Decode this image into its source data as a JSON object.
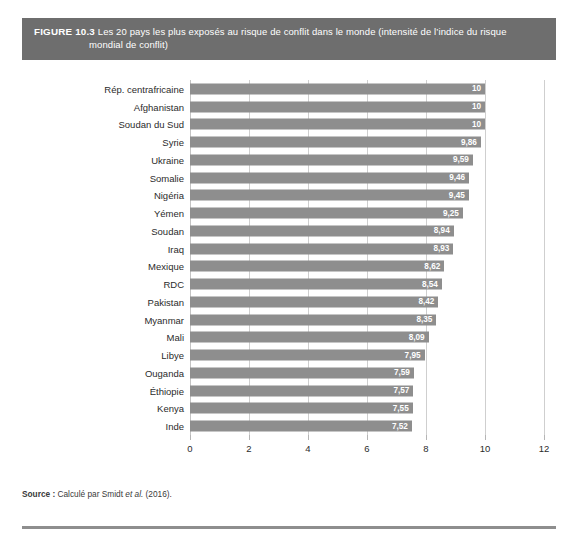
{
  "figure": {
    "number": "FIGURE 10.3",
    "caption_line1": "Les 20 pays les plus exposés au risque de conflit dans le monde (intensité de l’indice du risque",
    "caption_line2": "mondial de conflit)"
  },
  "source": {
    "label": "Source :",
    "text_before_italic": " Calculé par Smidt ",
    "italic": "et al.",
    "text_after_italic": " (2016)."
  },
  "colors": {
    "header_band": "#6e6e6e",
    "bar_fill": "#8e8e8e",
    "gridline": "#cfcfcf",
    "value_label": "#ffffff",
    "bottom_rule": "#8e8e8e"
  },
  "chart_data": {
    "type": "bar",
    "orientation": "horizontal",
    "title": "Les 20 pays les plus exposés au risque de conflit dans le monde (intensité de l’indice du risque mondial de conflit)",
    "xlabel": "",
    "ylabel": "",
    "xlim": [
      0,
      12
    ],
    "xticks": [
      "0",
      "2",
      "4",
      "6",
      "8",
      "10",
      "12"
    ],
    "xtick_values": [
      0,
      2,
      4,
      6,
      8,
      10,
      12
    ],
    "grid": "vertical",
    "legend": "none",
    "decimal_separator": ",",
    "categories": [
      "Rép. centrafricaine",
      "Afghanistan",
      "Soudan du Sud",
      "Syrie",
      "Ukraine",
      "Somalie",
      "Nigéria",
      "Yémen",
      "Soudan",
      "Iraq",
      "Mexique",
      "RDC",
      "Pakistan",
      "Myanmar",
      "Mali",
      "Libye",
      "Ouganda",
      "Éthiopie",
      "Kenya",
      "Inde"
    ],
    "values": [
      10,
      10,
      10,
      9.86,
      9.59,
      9.46,
      9.45,
      9.25,
      8.94,
      8.93,
      8.62,
      8.54,
      8.42,
      8.35,
      8.09,
      7.95,
      7.59,
      7.57,
      7.55,
      7.52
    ],
    "value_labels": [
      "10",
      "10",
      "10",
      "9,86",
      "9,59",
      "9,46",
      "9,45",
      "9,25",
      "8,94",
      "8,93",
      "8,62",
      "8,54",
      "8,42",
      "8,35",
      "8,09",
      "7,95",
      "7,59",
      "7,57",
      "7,55",
      "7,52"
    ]
  }
}
